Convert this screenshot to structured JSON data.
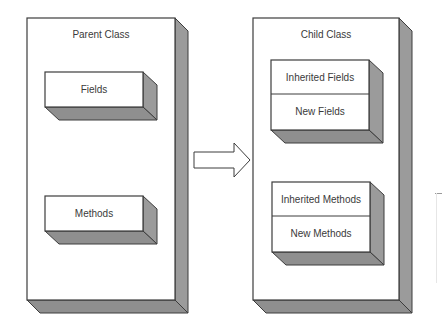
{
  "diagram": {
    "colors": {
      "face": "#ffffff",
      "side": "#9b9b9b",
      "bottom": "#8f8f8f",
      "stroke": "#3c3c3c",
      "text": "#3a3a3a"
    },
    "parent": {
      "title": "Parent Class",
      "sections": [
        {
          "label": "Fields"
        },
        {
          "label": "Methods"
        }
      ]
    },
    "arrow": {
      "direction": "right",
      "meaning": "inherits"
    },
    "child": {
      "title": "Child Class",
      "groups": [
        {
          "rows": [
            {
              "label": "Inherited Fields"
            },
            {
              "label": "New Fields"
            }
          ]
        },
        {
          "rows": [
            {
              "label": "Inherited Methods"
            },
            {
              "label": "New Methods"
            }
          ]
        }
      ]
    }
  }
}
